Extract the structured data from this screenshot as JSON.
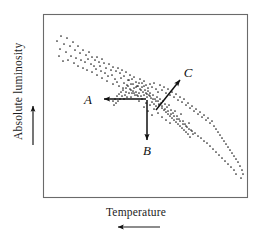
{
  "figure": {
    "title": "",
    "type": "scatter-annotated",
    "background": "#ffffff",
    "frame_color": "#6a6a6a",
    "ink_color": "#111111"
  },
  "axes": {
    "y_label": "Absolute luminosity",
    "y_direction_arrow": "up-arrow-icon",
    "x_label": "Temperature",
    "x_direction_arrow": "left-arrow-icon"
  },
  "annotations": [
    {
      "id": "A",
      "label": "A",
      "direction": "left",
      "label_x": 92,
      "label_y": 101
    },
    {
      "id": "B",
      "label": "B",
      "direction": "down",
      "label_x": 147,
      "label_y": 155
    },
    {
      "id": "C",
      "label": "C",
      "direction": "up-right",
      "label_x": 187,
      "label_y": 77
    }
  ],
  "chart_data": {
    "type": "scatter",
    "title": "",
    "xlabel": "Temperature",
    "ylabel": "Absolute luminosity",
    "xlim": [
      0,
      100
    ],
    "ylim": [
      0,
      100
    ],
    "grid": false,
    "legend": null,
    "axis_tick_labels": {
      "x": [],
      "y": []
    },
    "axis_direction_notes": {
      "x": "Temperature increases to the left (arrow points left)",
      "y": "Absolute luminosity increases upward (arrow points up)"
    },
    "series": [
      {
        "name": "stars",
        "marker": "dot",
        "color": "#202020",
        "points_px": [
          [
            57,
            41
          ],
          [
            61,
            36
          ],
          [
            64,
            44
          ],
          [
            67,
            38
          ],
          [
            60,
            49
          ],
          [
            70,
            46
          ],
          [
            66,
            52
          ],
          [
            73,
            42
          ],
          [
            59,
            56
          ],
          [
            75,
            50
          ],
          [
            71,
            56
          ],
          [
            63,
            61
          ],
          [
            78,
            46
          ],
          [
            80,
            53
          ],
          [
            68,
            60
          ],
          [
            76,
            58
          ],
          [
            83,
            50
          ],
          [
            74,
            63
          ],
          [
            86,
            55
          ],
          [
            81,
            60
          ],
          [
            89,
            52
          ],
          [
            78,
            66
          ],
          [
            92,
            57
          ],
          [
            85,
            62
          ],
          [
            88,
            59
          ],
          [
            95,
            60
          ],
          [
            91,
            64
          ],
          [
            83,
            68
          ],
          [
            97,
            57
          ],
          [
            94,
            66
          ],
          [
            99,
            62
          ],
          [
            87,
            70
          ],
          [
            102,
            59
          ],
          [
            96,
            69
          ],
          [
            100,
            66
          ],
          [
            104,
            63
          ],
          [
            92,
            72
          ],
          [
            106,
            68
          ],
          [
            101,
            71
          ],
          [
            109,
            64
          ],
          [
            97,
            75
          ],
          [
            111,
            70
          ],
          [
            105,
            73
          ],
          [
            113,
            67
          ],
          [
            108,
            76
          ],
          [
            116,
            71
          ],
          [
            102,
            78
          ],
          [
            118,
            68
          ],
          [
            112,
            75
          ],
          [
            120,
            73
          ],
          [
            115,
            79
          ],
          [
            122,
            70
          ],
          [
            107,
            81
          ],
          [
            124,
            76
          ],
          [
            117,
            82
          ],
          [
            126,
            72
          ],
          [
            121,
            78
          ],
          [
            128,
            80
          ],
          [
            113,
            84
          ],
          [
            130,
            75
          ],
          [
            124,
            83
          ],
          [
            132,
            79
          ],
          [
            119,
            86
          ],
          [
            134,
            77
          ],
          [
            127,
            85
          ],
          [
            136,
            82
          ],
          [
            129,
            80
          ],
          [
            138,
            86
          ],
          [
            123,
            88
          ],
          [
            140,
            79
          ],
          [
            133,
            84
          ],
          [
            142,
            83
          ],
          [
            131,
            90
          ],
          [
            144,
            81
          ],
          [
            136,
            87
          ],
          [
            146,
            85
          ],
          [
            126,
            92
          ],
          [
            148,
            88
          ],
          [
            139,
            83
          ],
          [
            150,
            84
          ],
          [
            134,
            93
          ],
          [
            152,
            87
          ],
          [
            141,
            90
          ],
          [
            154,
            83
          ],
          [
            137,
            95
          ],
          [
            156,
            89
          ],
          [
            144,
            86
          ],
          [
            158,
            92
          ],
          [
            131,
            97
          ],
          [
            160,
            85
          ],
          [
            147,
            94
          ],
          [
            162,
            90
          ],
          [
            142,
            99
          ],
          [
            164,
            87
          ],
          [
            150,
            96
          ],
          [
            166,
            93
          ],
          [
            139,
            101
          ],
          [
            168,
            89
          ],
          [
            153,
            99
          ],
          [
            170,
            95
          ],
          [
            146,
            103
          ],
          [
            172,
            92
          ],
          [
            156,
            101
          ],
          [
            174,
            97
          ],
          [
            150,
            105
          ],
          [
            176,
            94
          ],
          [
            159,
            104
          ],
          [
            178,
            100
          ],
          [
            144,
            107
          ],
          [
            180,
            97
          ],
          [
            162,
            106
          ],
          [
            182,
            102
          ],
          [
            154,
            109
          ],
          [
            184,
            99
          ],
          [
            165,
            109
          ],
          [
            186,
            105
          ],
          [
            148,
            111
          ],
          [
            188,
            103
          ],
          [
            168,
            111
          ],
          [
            190,
            108
          ],
          [
            158,
            113
          ],
          [
            192,
            106
          ],
          [
            171,
            114
          ],
          [
            194,
            111
          ],
          [
            152,
            115
          ],
          [
            196,
            109
          ],
          [
            174,
            116
          ],
          [
            198,
            114
          ],
          [
            162,
            117
          ],
          [
            200,
            112
          ],
          [
            177,
            119
          ],
          [
            202,
            117
          ],
          [
            166,
            120
          ],
          [
            204,
            115
          ],
          [
            180,
            121
          ],
          [
            206,
            120
          ],
          [
            170,
            123
          ],
          [
            208,
            118
          ],
          [
            183,
            124
          ],
          [
            210,
            123
          ],
          [
            186,
            126
          ],
          [
            212,
            121
          ],
          [
            189,
            129
          ],
          [
            214,
            126
          ],
          [
            192,
            131
          ],
          [
            216,
            129
          ],
          [
            195,
            133
          ],
          [
            218,
            132
          ],
          [
            198,
            136
          ],
          [
            220,
            135
          ],
          [
            201,
            138
          ],
          [
            222,
            138
          ],
          [
            204,
            141
          ],
          [
            224,
            141
          ],
          [
            207,
            143
          ],
          [
            226,
            144
          ],
          [
            210,
            146
          ],
          [
            228,
            147
          ],
          [
            213,
            149
          ],
          [
            230,
            150
          ],
          [
            216,
            152
          ],
          [
            232,
            153
          ],
          [
            219,
            155
          ],
          [
            234,
            156
          ],
          [
            222,
            158
          ],
          [
            236,
            159
          ],
          [
            225,
            161
          ],
          [
            238,
            162
          ],
          [
            228,
            164
          ],
          [
            240,
            166
          ],
          [
            231,
            167
          ],
          [
            242,
            170
          ],
          [
            234,
            170
          ],
          [
            243,
            174
          ],
          [
            236,
            174
          ],
          [
            241,
            178
          ],
          [
            128,
            86
          ],
          [
            131,
            84
          ],
          [
            134,
            88
          ],
          [
            137,
            86
          ],
          [
            140,
            89
          ],
          [
            133,
            91
          ],
          [
            136,
            92
          ],
          [
            142,
            87
          ],
          [
            139,
            93
          ],
          [
            145,
            90
          ],
          [
            130,
            89
          ],
          [
            143,
            92
          ],
          [
            146,
            93
          ],
          [
            135,
            95
          ],
          [
            138,
            96
          ],
          [
            148,
            91
          ],
          [
            141,
            96
          ],
          [
            144,
            95
          ],
          [
            147,
            97
          ],
          [
            150,
            93
          ],
          [
            132,
            93
          ],
          [
            149,
            95
          ],
          [
            151,
            98
          ],
          [
            153,
            95
          ],
          [
            155,
            99
          ],
          [
            152,
            102
          ],
          [
            157,
            97
          ],
          [
            154,
            104
          ],
          [
            158,
            101
          ],
          [
            156,
            106
          ],
          [
            160,
            99
          ],
          [
            159,
            105
          ],
          [
            161,
            103
          ],
          [
            163,
            101
          ],
          [
            162,
            108
          ],
          [
            165,
            104
          ],
          [
            164,
            110
          ],
          [
            167,
            107
          ],
          [
            166,
            112
          ],
          [
            169,
            105
          ],
          [
            168,
            114
          ],
          [
            171,
            110
          ],
          [
            170,
            116
          ],
          [
            173,
            113
          ],
          [
            172,
            118
          ],
          [
            175,
            111
          ],
          [
            174,
            120
          ],
          [
            177,
            116
          ],
          [
            176,
            122
          ],
          [
            179,
            119
          ],
          [
            178,
            124
          ],
          [
            181,
            114
          ],
          [
            180,
            126
          ],
          [
            183,
            121
          ],
          [
            182,
            128
          ],
          [
            185,
            124
          ],
          [
            184,
            130
          ],
          [
            187,
            127
          ],
          [
            186,
            132
          ],
          [
            189,
            123
          ],
          [
            188,
            134
          ],
          [
            191,
            130
          ],
          [
            190,
            137
          ],
          [
            193,
            134
          ],
          [
            126,
            88
          ],
          [
            129,
            93
          ],
          [
            123,
            90
          ],
          [
            125,
            95
          ],
          [
            121,
            92
          ],
          [
            127,
            97
          ],
          [
            124,
            99
          ],
          [
            122,
            96
          ],
          [
            119,
            94
          ],
          [
            120,
            99
          ],
          [
            117,
            96
          ],
          [
            118,
            101
          ],
          [
            115,
            99
          ],
          [
            116,
            103
          ],
          [
            113,
            101
          ],
          [
            114,
            105
          ]
        ]
      }
    ]
  }
}
